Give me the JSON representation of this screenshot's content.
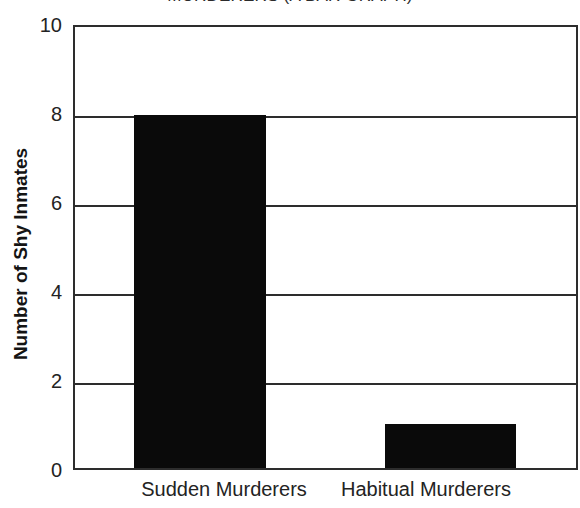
{
  "chart_data": {
    "type": "bar",
    "title": "MURDERERS (A BAR GRAPH)",
    "xlabel": "",
    "ylabel": "Number of Shy Inmates",
    "categories": [
      "Sudden Murderers",
      "Habitual Murderers"
    ],
    "values": [
      8,
      1
    ],
    "ylim": [
      0,
      10
    ],
    "yticks": [
      "0",
      "2",
      "4",
      "6",
      "8",
      "10"
    ],
    "ytick_values": [
      0,
      2,
      4,
      6,
      8,
      10
    ],
    "gridlines": [
      2,
      4,
      6,
      8
    ],
    "grid": true,
    "legend": "none",
    "bar_color": "#0a0a0a",
    "axis_color": "#2d2d2d",
    "background": "#ffffff"
  },
  "figure": {
    "title_note": "title is clipped by the top edge of the image"
  }
}
